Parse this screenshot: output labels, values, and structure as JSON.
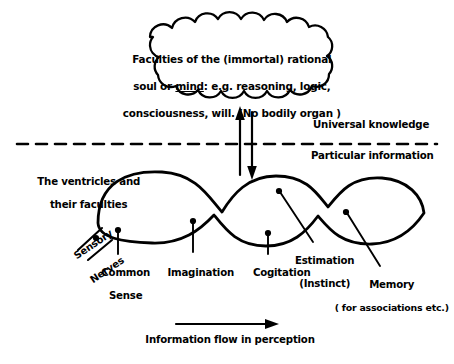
{
  "diagram": {
    "title_concept": "Medieval ventricular theory of brain faculties",
    "cloud": {
      "line1": "Faculties of the (immortal) rational",
      "line2_a": "soul or ",
      "line2_underlined": "mind",
      "line2_b": ": e.g. reasoning, logic,",
      "line3": "consciousness, will. (No bodily organ )"
    },
    "divider": {
      "above_label": "Universal knowledge",
      "below_label": "Particular information"
    },
    "left_caption": {
      "line1": "The ventricles and",
      "line2": "their faculties"
    },
    "sensory": {
      "line1": "Sensory",
      "line2": "Nerves"
    },
    "ventricle_labels": [
      {
        "id": "common-sense",
        "line1": "Common",
        "line2": "Sense"
      },
      {
        "id": "imagination",
        "line1": "Imagination",
        "line2": ""
      },
      {
        "id": "cogitation",
        "line1": "Cogitation",
        "line2": ""
      },
      {
        "id": "estimation",
        "line1": "Estimation",
        "line2": "(Instinct)"
      },
      {
        "id": "memory",
        "line1": "Memory",
        "line2": "( for associations etc.)"
      }
    ],
    "flow_caption": "Information flow in perception",
    "colors": {
      "ink": "#000000",
      "background": "#ffffff"
    }
  }
}
